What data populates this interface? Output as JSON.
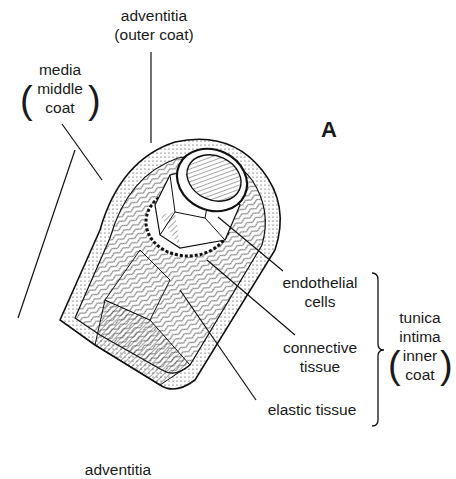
{
  "figure": {
    "panel_letter": "A",
    "labels": {
      "adventitia": {
        "line1": "adventitia",
        "line2": "(outer coat)"
      },
      "media": {
        "line1": "media",
        "line2": "middle",
        "line3": "coat"
      },
      "endothelial": {
        "line1": "endothelial",
        "line2": "cells"
      },
      "connective": {
        "line1": "connective",
        "line2": "tissue"
      },
      "elastic": {
        "line1": "elastic tissue"
      },
      "tunica_intima": {
        "line1": "tunica",
        "line2": "intima",
        "line3": "inner",
        "line4": "coat"
      },
      "bottom_cut": {
        "line1": "adventitia"
      }
    },
    "paren_open": "(",
    "paren_close": ")"
  }
}
